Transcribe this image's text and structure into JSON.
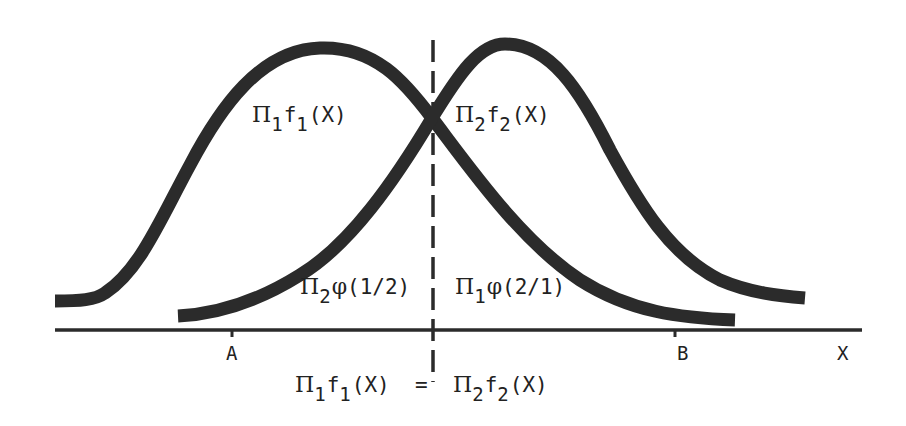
{
  "diagram": {
    "colors": {
      "curve": "#2b2b2b",
      "axis": "#2b2b2b",
      "background": "#ffffff"
    },
    "curves": [
      {
        "name": "pi1-f1",
        "label": {
          "pi": "Π",
          "pi_sub": "1",
          "f": "f",
          "f_sub": "1",
          "arg": "(X)"
        }
      },
      {
        "name": "pi2-f2",
        "label": {
          "pi": "Π",
          "pi_sub": "2",
          "f": "f",
          "f_sub": "2",
          "arg": "(X)"
        }
      }
    ],
    "regions": {
      "left": {
        "pi": "Π",
        "pi_sub": "2",
        "phi": "φ",
        "arg": "(1/2)"
      },
      "right": {
        "pi": "Π",
        "pi_sub": "1",
        "phi": "φ",
        "arg": "(2/1)"
      }
    },
    "axis": {
      "label": "X",
      "ticks": [
        "A",
        "B"
      ]
    },
    "boundary_equation": {
      "lhs": {
        "pi": "Π",
        "pi_sub": "1",
        "f": "f",
        "f_sub": "1",
        "arg": "(X)"
      },
      "op": "=",
      "rhs": {
        "pi": "Π",
        "pi_sub": "2",
        "f": "f",
        "f_sub": "2",
        "arg": "(X)"
      }
    }
  }
}
